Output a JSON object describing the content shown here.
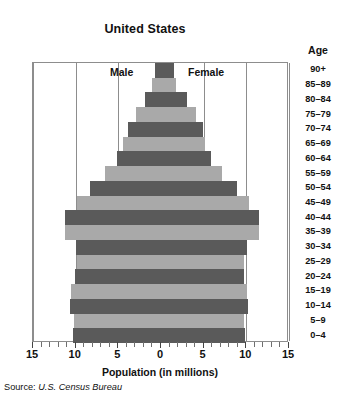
{
  "chart": {
    "title": "United States",
    "age_header": "Age",
    "xaxis_title": "Population (in millions)",
    "source_label": "Source:",
    "source_value": "U.S. Census Bureau",
    "male_label": "Male",
    "female_label": "Female",
    "colors": {
      "dark_bar": "#5a5a5a",
      "light_bar": "#a9a9a9",
      "frame": "#8d8d8d",
      "text": "#111111",
      "background": "#ffffff"
    }
  },
  "chart_data": {
    "type": "bar",
    "subtype": "population-pyramid",
    "title": "United States",
    "xlabel": "Population (in millions)",
    "ylabel": "Age",
    "xlim": [
      -15,
      15
    ],
    "xticks": [
      -15,
      -10,
      -5,
      0,
      5,
      10,
      15
    ],
    "xtick_labels": [
      "15",
      "10",
      "5",
      "0",
      "5",
      "10",
      "15"
    ],
    "minor_tick_step": 1,
    "grid": true,
    "grid_axis": "x",
    "legend": "inline",
    "legend_entries": [
      "Male",
      "Female"
    ],
    "annotations": [
      "Male",
      "Female"
    ],
    "source": "Source: U.S. Census Bureau",
    "categories": [
      "90+",
      "85-89",
      "80-84",
      "75-79",
      "70-74",
      "65-69",
      "60-64",
      "55-59",
      "50-54",
      "45-49",
      "40-44",
      "35-39",
      "30-34",
      "25-29",
      "20-24",
      "15-19",
      "10-14",
      "5-9",
      "0-4"
    ],
    "series": [
      {
        "name": "Male",
        "side": "left",
        "color": "#5a5a5a",
        "values": [
          0.7,
          1.0,
          1.9,
          2.9,
          3.9,
          4.4,
          5.2,
          6.6,
          8.3,
          9.9,
          11.2,
          11.3,
          10.0,
          9.8,
          10.1,
          10.6,
          10.7,
          10.2,
          10.3
        ]
      },
      {
        "name": "Female",
        "side": "right",
        "color": "#5a5a5a",
        "values": [
          1.5,
          1.8,
          3.0,
          4.1,
          4.9,
          5.2,
          5.9,
          7.2,
          8.9,
          10.3,
          11.5,
          11.5,
          10.1,
          9.7,
          9.7,
          10.1,
          10.2,
          9.7,
          9.8
        ]
      }
    ],
    "bar_shading": [
      "dark",
      "light",
      "dark",
      "light",
      "dark",
      "light",
      "dark",
      "light",
      "dark",
      "light",
      "dark",
      "light",
      "dark",
      "light",
      "dark",
      "light",
      "dark",
      "light",
      "dark"
    ]
  }
}
